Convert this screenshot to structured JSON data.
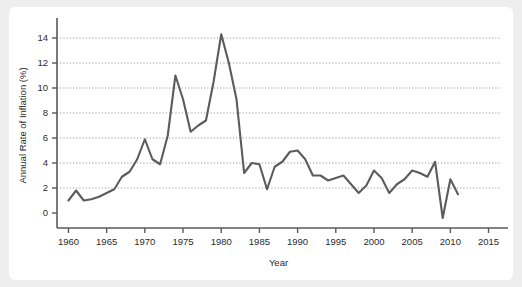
{
  "card": {
    "background_color": "#ffffff",
    "page_background_color": "#eeeeee"
  },
  "chart_data": {
    "type": "line",
    "title": "",
    "subtitle": "",
    "xlabel": "Year",
    "ylabel": "Annual Rate of Inflation (%)",
    "xlim": [
      1958.5,
      2016.5
    ],
    "ylim": [
      -1.2,
      15.2
    ],
    "xticks": [
      1960,
      1965,
      1970,
      1975,
      1980,
      1985,
      1990,
      1995,
      2000,
      2005,
      2010,
      2015
    ],
    "xtick_labels": [
      "1960",
      "1965",
      "1970",
      "1975",
      "1980",
      "1985",
      "1990",
      "1995",
      "2000",
      "2005",
      "2010",
      "2015"
    ],
    "yticks": [
      0,
      2,
      4,
      6,
      8,
      10,
      12,
      14
    ],
    "ytick_labels": [
      "0",
      "2",
      "4",
      "6",
      "8",
      "10",
      "12",
      "14"
    ],
    "grid": true,
    "grid_axis": "y",
    "legend": false,
    "legend_position": "none",
    "line_color": "#5c5c5c",
    "x": [
      1960,
      1961,
      1962,
      1963,
      1964,
      1965,
      1966,
      1967,
      1968,
      1969,
      1970,
      1971,
      1972,
      1973,
      1974,
      1975,
      1976,
      1977,
      1978,
      1979,
      1980,
      1981,
      1982,
      1983,
      1984,
      1985,
      1986,
      1987,
      1988,
      1989,
      1990,
      1991,
      1992,
      1993,
      1994,
      1995,
      1996,
      1997,
      1998,
      1999,
      2000,
      2001,
      2002,
      2003,
      2004,
      2005,
      2006,
      2007,
      2008,
      2009,
      2010,
      2011
    ],
    "values": [
      1.0,
      1.8,
      1.0,
      1.1,
      1.3,
      1.6,
      1.9,
      2.9,
      3.3,
      4.3,
      5.9,
      4.3,
      3.9,
      6.2,
      11.0,
      9.1,
      6.5,
      7.0,
      7.4,
      10.5,
      14.3,
      12.0,
      9.1,
      3.2,
      4.0,
      3.9,
      1.9,
      3.7,
      4.1,
      4.9,
      5.0,
      4.3,
      3.0,
      3.0,
      2.6,
      2.8,
      3.0,
      2.3,
      1.6,
      2.2,
      3.4,
      2.8,
      1.6,
      2.3,
      2.7,
      3.4,
      3.2,
      2.9,
      4.1,
      -0.4,
      2.7,
      1.5
    ]
  }
}
